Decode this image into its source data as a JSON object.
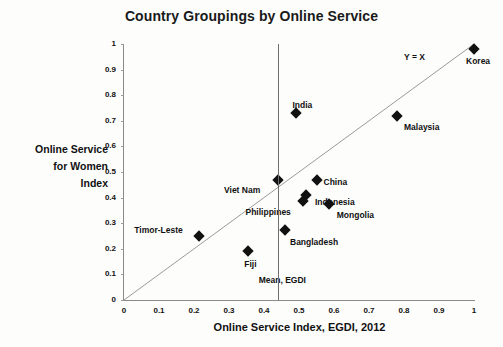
{
  "chart_data": {
    "type": "scatter",
    "title": "Country Groupings by Online Service",
    "xlabel": "Online Service Index, EGDI, 2012",
    "ylabel": "Online Service for Women Index",
    "ylabel_lines": [
      "Online Service",
      "for Women",
      "Index"
    ],
    "xlim": [
      0,
      1
    ],
    "ylim": [
      0,
      1
    ],
    "grid": false,
    "legend": false,
    "xticks": [
      "0",
      "0.1",
      "0.2",
      "0.3",
      "0.4",
      "0.5",
      "0.6",
      "0.7",
      "0.8",
      "0.9",
      "1"
    ],
    "xtick_values": [
      0,
      0.1,
      0.2,
      0.3,
      0.4,
      0.5,
      0.6,
      0.7,
      0.8,
      0.9,
      1
    ],
    "yticks": [
      "0",
      "0.1",
      "0.2",
      "0.3",
      "0.4",
      "0.5",
      "0.6",
      "0.7",
      "0.8",
      "0.9",
      "1"
    ],
    "ytick_values": [
      0,
      0.1,
      0.2,
      0.3,
      0.4,
      0.5,
      0.6,
      0.7,
      0.8,
      0.9,
      1
    ],
    "marker_color": "#111111",
    "axis_color": "#8a8a8a",
    "points": [
      {
        "label": "Korea",
        "x": 1.0,
        "y": 0.98,
        "label_dx": -8,
        "label_dy": 13
      },
      {
        "label": "Malaysia",
        "x": 0.78,
        "y": 0.72,
        "label_dx": 7,
        "label_dy": 12
      },
      {
        "label": "India",
        "x": 0.49,
        "y": 0.73,
        "label_dx": -3,
        "label_dy": -7
      },
      {
        "label": "Viet Nam",
        "x": 0.44,
        "y": 0.47,
        "label_dx": -54,
        "label_dy": 11
      },
      {
        "label": "China",
        "x": 0.55,
        "y": 0.47,
        "label_dx": 7,
        "label_dy": 3
      },
      {
        "label": "Indonesia",
        "x": 0.52,
        "y": 0.41,
        "label_dx": 9,
        "label_dy": 8
      },
      {
        "label": "Philippines",
        "x": 0.51,
        "y": 0.385,
        "label_dx": -57,
        "label_dy": 12
      },
      {
        "label": "Mongolia",
        "x": 0.585,
        "y": 0.375,
        "label_dx": 8,
        "label_dy": 12
      },
      {
        "label": "Bangladesh",
        "x": 0.46,
        "y": 0.275,
        "label_dx": 5,
        "label_dy": 13
      },
      {
        "label": "Timor-Leste",
        "x": 0.215,
        "y": 0.25,
        "label_dx": -65,
        "label_dy": -5
      },
      {
        "label": "Fiji",
        "x": 0.355,
        "y": 0.19,
        "label_dx": -4,
        "label_dy": 14
      }
    ],
    "annotations": [
      {
        "name": "identity-line-label",
        "text": "Y = X",
        "x": 0.8,
        "y": 0.945
      },
      {
        "name": "mean-line-label",
        "text": "Mean, EGDI",
        "x": 0.385,
        "y": 0.075
      }
    ],
    "reference_lines": [
      {
        "name": "identity-line",
        "type": "diagonal",
        "from": [
          0,
          0
        ],
        "to": [
          1,
          1
        ],
        "color": "#9a9a9a"
      },
      {
        "name": "mean-egdi-line",
        "type": "vertical",
        "value": 0.44,
        "color": "#6e6e6e"
      }
    ]
  }
}
